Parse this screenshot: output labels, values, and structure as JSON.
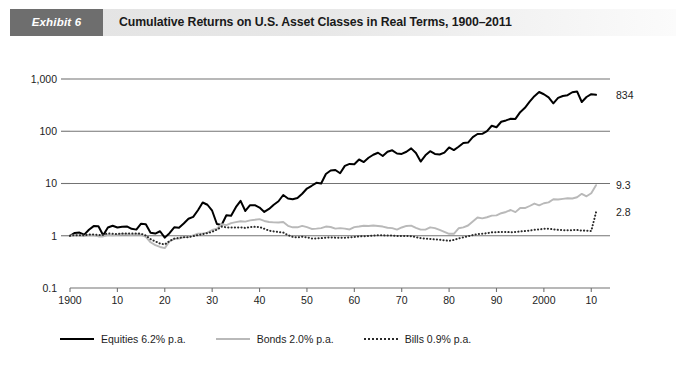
{
  "header": {
    "badge_label": "Exhibit 6",
    "title": "Cumulative Returns on U.S. Asset Classes in Real Terms, 1900–2011",
    "badge_color": "#6e6e6e",
    "bar_color": "#e5e5e5"
  },
  "legend": {
    "items": [
      {
        "name": "equities",
        "label": "Equities  6.2% p.a.",
        "color": "#000000",
        "style": "solid"
      },
      {
        "name": "bonds",
        "label": "Bonds 2.0% p.a.",
        "color": "#b9b9b9",
        "style": "solid"
      },
      {
        "name": "bills",
        "label": "Bills 0.9% p.a.",
        "color": "#2a2a2a",
        "style": "dotted"
      }
    ]
  },
  "end_labels": {
    "equities": "834",
    "bonds": "9.3",
    "bills": "2.8"
  },
  "chart_data": {
    "type": "line",
    "title": "Cumulative Returns on U.S. Asset Classes in Real Terms, 1900–2011",
    "xlabel": "",
    "ylabel": "",
    "yscale": "log",
    "ylim": [
      0.1,
      1000
    ],
    "yticks": [
      0.1,
      1,
      10,
      100,
      1000
    ],
    "ytick_labels": [
      "0.1",
      "1",
      "10",
      "100",
      "1,000"
    ],
    "xlim": [
      1900,
      2011
    ],
    "xticks": [
      1900,
      1910,
      1920,
      1930,
      1940,
      1950,
      1960,
      1970,
      1980,
      1990,
      2000,
      2010
    ],
    "xtick_labels": [
      "1900",
      "10",
      "20",
      "30",
      "40",
      "50",
      "60",
      "70",
      "80",
      "90",
      "2000",
      "10"
    ],
    "grid": true,
    "gridlines_y": [
      1,
      10,
      100,
      1000
    ],
    "legend_position": "bottom",
    "annotations": [
      {
        "series": "Equities",
        "value": 834,
        "text": "834"
      },
      {
        "series": "Bonds",
        "value": 9.3,
        "text": "9.3"
      },
      {
        "series": "Bills",
        "value": 2.8,
        "text": "2.8"
      }
    ],
    "x": [
      1900,
      1901,
      1902,
      1903,
      1904,
      1905,
      1906,
      1907,
      1908,
      1909,
      1910,
      1911,
      1912,
      1913,
      1914,
      1915,
      1916,
      1917,
      1918,
      1919,
      1920,
      1921,
      1922,
      1923,
      1924,
      1925,
      1926,
      1927,
      1928,
      1929,
      1930,
      1931,
      1932,
      1933,
      1934,
      1935,
      1936,
      1937,
      1938,
      1939,
      1940,
      1941,
      1942,
      1943,
      1944,
      1945,
      1946,
      1947,
      1948,
      1949,
      1950,
      1951,
      1952,
      1953,
      1954,
      1955,
      1956,
      1957,
      1958,
      1959,
      1960,
      1961,
      1962,
      1963,
      1964,
      1965,
      1966,
      1967,
      1968,
      1969,
      1970,
      1971,
      1972,
      1973,
      1974,
      1975,
      1976,
      1977,
      1978,
      1979,
      1980,
      1981,
      1982,
      1983,
      1984,
      1985,
      1986,
      1987,
      1988,
      1989,
      1990,
      1991,
      1992,
      1993,
      1994,
      1995,
      1996,
      1997,
      1998,
      1999,
      2000,
      2001,
      2002,
      2003,
      2004,
      2005,
      2006,
      2007,
      2008,
      2009,
      2010,
      2011
    ],
    "series": [
      {
        "name": "Equities",
        "annual_real_return_pct": 6.2,
        "color": "#000000",
        "style": "solid",
        "values": [
          1.0,
          1.13,
          1.15,
          1.05,
          1.3,
          1.53,
          1.52,
          1.02,
          1.44,
          1.55,
          1.44,
          1.49,
          1.51,
          1.36,
          1.31,
          1.7,
          1.66,
          1.14,
          1.1,
          1.22,
          0.92,
          1.12,
          1.45,
          1.43,
          1.72,
          2.12,
          2.3,
          3.08,
          4.33,
          3.92,
          3.01,
          1.68,
          1.61,
          2.47,
          2.41,
          3.52,
          4.66,
          2.98,
          3.84,
          3.84,
          3.46,
          2.86,
          3.26,
          3.93,
          4.57,
          6.03,
          5.15,
          4.98,
          5.26,
          6.37,
          8.02,
          9.05,
          10.3,
          10.03,
          15.23,
          17.75,
          18.13,
          15.7,
          21.74,
          23.7,
          23.31,
          28.8,
          25.78,
          31.06,
          35.47,
          38.77,
          33.64,
          40.45,
          43.15,
          37.47,
          36.86,
          40.47,
          46.97,
          38.32,
          26.34,
          34.66,
          41.59,
          36.76,
          35.95,
          39.01,
          48.93,
          43.63,
          50.45,
          59.68,
          60.69,
          77.11,
          88.71,
          89.54,
          100.47,
          127.57,
          119.26,
          152.06,
          161.06,
          173.78,
          172.29,
          232.09,
          281.21,
          370.13,
          470.16,
          564.08,
          510.3,
          443.74,
          342.11,
          434.51,
          473.14,
          489.28,
          557.57,
          578.47,
          363.08,
          451.92,
          513.12,
          498.0
        ]
      },
      {
        "name": "Bonds",
        "annual_real_return_pct": 2.0,
        "color": "#b9b9b9",
        "style": "solid",
        "values": [
          1.0,
          1.02,
          1.01,
          0.99,
          1.03,
          1.02,
          0.97,
          0.97,
          1.04,
          1.02,
          1.04,
          1.08,
          1.07,
          1.04,
          1.07,
          1.05,
          0.95,
          0.75,
          0.66,
          0.61,
          0.58,
          0.78,
          0.87,
          0.88,
          0.94,
          0.95,
          1.02,
          1.1,
          1.11,
          1.15,
          1.29,
          1.36,
          1.66,
          1.6,
          1.74,
          1.82,
          1.89,
          1.86,
          1.97,
          2.02,
          2.08,
          1.92,
          1.83,
          1.8,
          1.79,
          1.83,
          1.55,
          1.45,
          1.45,
          1.54,
          1.46,
          1.35,
          1.37,
          1.4,
          1.5,
          1.47,
          1.37,
          1.4,
          1.37,
          1.32,
          1.46,
          1.5,
          1.55,
          1.54,
          1.57,
          1.54,
          1.5,
          1.42,
          1.4,
          1.31,
          1.44,
          1.54,
          1.56,
          1.42,
          1.31,
          1.31,
          1.45,
          1.4,
          1.3,
          1.19,
          1.09,
          1.09,
          1.39,
          1.45,
          1.57,
          1.88,
          2.23,
          2.15,
          2.26,
          2.43,
          2.45,
          2.7,
          2.85,
          3.11,
          2.83,
          3.4,
          3.39,
          3.71,
          4.13,
          3.81,
          4.19,
          4.35,
          4.99,
          4.93,
          5.09,
          5.21,
          5.17,
          5.45,
          6.34,
          5.69,
          6.53,
          9.3
        ]
      },
      {
        "name": "Bills",
        "annual_real_return_pct": 0.9,
        "color": "#2a2a2a",
        "style": "dotted",
        "values": [
          1.0,
          1.03,
          1.02,
          1.02,
          1.05,
          1.06,
          1.03,
          1.05,
          1.11,
          1.09,
          1.08,
          1.11,
          1.1,
          1.1,
          1.11,
          1.09,
          1.01,
          0.86,
          0.78,
          0.71,
          0.68,
          0.79,
          0.88,
          0.91,
          0.94,
          0.94,
          0.98,
          1.03,
          1.07,
          1.12,
          1.19,
          1.31,
          1.49,
          1.45,
          1.44,
          1.44,
          1.45,
          1.41,
          1.47,
          1.48,
          1.47,
          1.36,
          1.25,
          1.21,
          1.18,
          1.15,
          1.03,
          0.95,
          0.93,
          0.96,
          0.93,
          0.89,
          0.89,
          0.9,
          0.92,
          0.93,
          0.92,
          0.92,
          0.92,
          0.93,
          0.95,
          0.97,
          0.98,
          0.99,
          1.01,
          1.02,
          1.02,
          1.01,
          1.01,
          0.99,
          0.99,
          0.99,
          0.98,
          0.94,
          0.9,
          0.88,
          0.87,
          0.85,
          0.84,
          0.82,
          0.8,
          0.83,
          0.89,
          0.93,
          0.98,
          1.03,
          1.08,
          1.09,
          1.12,
          1.16,
          1.17,
          1.18,
          1.18,
          1.17,
          1.18,
          1.21,
          1.23,
          1.26,
          1.3,
          1.32,
          1.36,
          1.36,
          1.33,
          1.3,
          1.28,
          1.27,
          1.28,
          1.29,
          1.26,
          1.25,
          1.23,
          2.8
        ]
      }
    ]
  }
}
